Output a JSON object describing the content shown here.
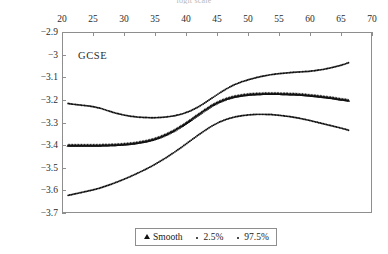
{
  "figure": {
    "clipped_top_text": "logit scale",
    "panel_label": "GCSE"
  },
  "legend": {
    "entries": [
      {
        "label": "Smooth",
        "marker": "triangle"
      },
      {
        "label": "2.5%",
        "marker": "dot"
      },
      {
        "label": "97.5%",
        "marker": "dot"
      }
    ]
  },
  "chart_data": {
    "type": "scatter",
    "title": "",
    "subtitle": "",
    "xlabel": "",
    "ylabel": "",
    "xlim": [
      20,
      70
    ],
    "ylim": [
      -3.7,
      -2.9
    ],
    "x_axis_position": "top",
    "grid": false,
    "legend_position": "bottom-center",
    "xticks": [
      20,
      25,
      30,
      35,
      40,
      45,
      50,
      55,
      60,
      65,
      70
    ],
    "yticks": [
      -2.9,
      -3,
      -3.1,
      -3.2,
      -3.3,
      -3.4,
      -3.5,
      -3.6,
      -3.7
    ],
    "xtick_labels": [
      "20",
      "25",
      "30",
      "35",
      "40",
      "45",
      "50",
      "55",
      "60",
      "65",
      "70"
    ],
    "ytick_labels": [
      "−2.9",
      "−3",
      "−3.1",
      "−3.2",
      "−3.3",
      "−3.4",
      "−3.5",
      "−3.6",
      "−3.7"
    ],
    "annotations": [
      {
        "text": "GCSE",
        "x": 24.5,
        "y": -3.02
      }
    ],
    "series": [
      {
        "name": "97.5%",
        "marker": "dot",
        "color": "#111111",
        "x": [
          21.0,
          22.0,
          23.0,
          24.0,
          25.0,
          26.2,
          27.4,
          28.6,
          29.8,
          31.0,
          32.2,
          33.4,
          34.6,
          35.8,
          37.0,
          38.2,
          39.4,
          40.6,
          41.8,
          43.0,
          44.2,
          45.4,
          46.6,
          47.8,
          49.0,
          50.2,
          51.4,
          52.6,
          53.8,
          55.0,
          56.2,
          57.4,
          58.6,
          59.8,
          61.0,
          62.2,
          63.4,
          64.6,
          65.6,
          66.2
        ],
        "y": [
          -3.216,
          -3.22,
          -3.223,
          -3.226,
          -3.23,
          -3.237,
          -3.248,
          -3.258,
          -3.266,
          -3.272,
          -3.276,
          -3.278,
          -3.279,
          -3.278,
          -3.275,
          -3.27,
          -3.262,
          -3.25,
          -3.234,
          -3.214,
          -3.192,
          -3.17,
          -3.15,
          -3.133,
          -3.12,
          -3.11,
          -3.101,
          -3.094,
          -3.088,
          -3.084,
          -3.081,
          -3.078,
          -3.076,
          -3.074,
          -3.07,
          -3.065,
          -3.058,
          -3.05,
          -3.042,
          -3.036
        ]
      },
      {
        "name": "Smooth",
        "marker": "triangle",
        "color": "#111111",
        "x": [
          21.0,
          22.0,
          23.0,
          24.0,
          25.0,
          26.2,
          27.4,
          28.6,
          29.8,
          31.0,
          32.2,
          33.4,
          34.6,
          35.8,
          37.0,
          38.2,
          39.4,
          40.6,
          41.8,
          43.0,
          44.2,
          45.4,
          46.6,
          47.8,
          49.0,
          50.2,
          51.4,
          52.6,
          53.8,
          55.0,
          56.2,
          57.4,
          58.6,
          59.8,
          61.0,
          62.2,
          63.4,
          64.6,
          65.6,
          66.2
        ],
        "y": [
          -3.4,
          -3.4,
          -3.4,
          -3.4,
          -3.4,
          -3.4,
          -3.399,
          -3.398,
          -3.396,
          -3.393,
          -3.389,
          -3.383,
          -3.375,
          -3.364,
          -3.35,
          -3.333,
          -3.313,
          -3.291,
          -3.268,
          -3.245,
          -3.224,
          -3.207,
          -3.194,
          -3.185,
          -3.179,
          -3.175,
          -3.173,
          -3.172,
          -3.172,
          -3.172,
          -3.173,
          -3.174,
          -3.176,
          -3.179,
          -3.182,
          -3.186,
          -3.19,
          -3.195,
          -3.199,
          -3.202
        ]
      },
      {
        "name": "2.5%",
        "marker": "dot",
        "color": "#111111",
        "x": [
          21.0,
          22.0,
          23.0,
          24.0,
          25.0,
          26.2,
          27.4,
          28.6,
          29.8,
          31.0,
          32.2,
          33.4,
          34.6,
          35.8,
          37.0,
          38.2,
          39.4,
          40.6,
          41.8,
          43.0,
          44.2,
          45.4,
          46.6,
          47.8,
          49.0,
          50.2,
          51.4,
          52.6,
          53.8,
          55.0,
          56.2,
          57.4,
          58.6,
          59.8,
          61.0,
          62.2,
          63.4,
          64.6,
          65.6,
          66.2
        ],
        "y": [
          -3.622,
          -3.616,
          -3.61,
          -3.604,
          -3.598,
          -3.589,
          -3.578,
          -3.566,
          -3.553,
          -3.539,
          -3.524,
          -3.508,
          -3.491,
          -3.472,
          -3.452,
          -3.43,
          -3.407,
          -3.383,
          -3.359,
          -3.336,
          -3.315,
          -3.298,
          -3.285,
          -3.276,
          -3.27,
          -3.266,
          -3.264,
          -3.264,
          -3.265,
          -3.268,
          -3.272,
          -3.277,
          -3.283,
          -3.29,
          -3.298,
          -3.306,
          -3.314,
          -3.322,
          -3.329,
          -3.334
        ]
      }
    ]
  }
}
